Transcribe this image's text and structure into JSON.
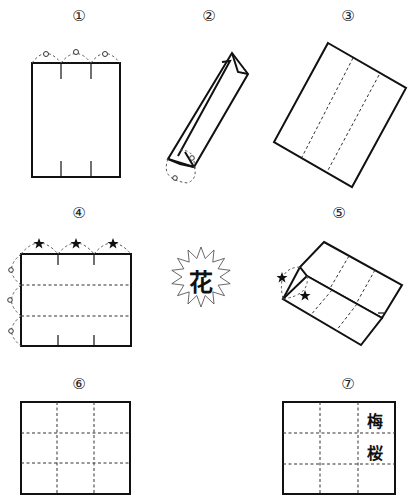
{
  "diagram": {
    "steps": [
      {
        "id": 1,
        "label": "①",
        "pos": [
          69,
          8
        ]
      },
      {
        "id": 2,
        "label": "②",
        "pos": [
          199,
          8
        ]
      },
      {
        "id": 3,
        "label": "③",
        "pos": [
          338,
          8
        ]
      },
      {
        "id": 4,
        "label": "④",
        "pos": [
          69,
          205
        ]
      },
      {
        "id": 5,
        "label": "⑤",
        "pos": [
          329,
          205
        ]
      },
      {
        "id": 6,
        "label": "⑥",
        "pos": [
          69,
          376
        ]
      },
      {
        "id": 7,
        "label": "⑦",
        "pos": [
          338,
          376
        ]
      }
    ],
    "burst": {
      "center": [
        201,
        277
      ],
      "outer_r": 30,
      "inner_r": 19,
      "points": 14,
      "character": "花"
    },
    "step7_labels": {
      "top_right_cell": "梅",
      "middle_right_cell": "桜"
    },
    "colors": {
      "line": "#111111",
      "background": "#ffffff",
      "dashed": "#333333"
    }
  }
}
